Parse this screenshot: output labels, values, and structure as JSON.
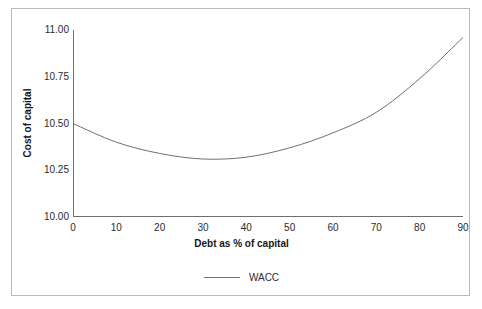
{
  "chart_data": {
    "type": "line",
    "title": "",
    "xlabel": "Debt as % of capital",
    "ylabel": "Cost of capital",
    "xlim": [
      0,
      90
    ],
    "ylim": [
      10.0,
      11.0
    ],
    "xticks": [
      "0",
      "10",
      "20",
      "30",
      "40",
      "50",
      "60",
      "70",
      "80",
      "90"
    ],
    "yticks": [
      "10.00",
      "10.25",
      "10.50",
      "10.75",
      "11.00"
    ],
    "grid": false,
    "legend_position": "bottom-center",
    "x": [
      0,
      10,
      20,
      30,
      40,
      50,
      60,
      70,
      80,
      90
    ],
    "series": [
      {
        "name": "WACC",
        "color": "#6f6f6f",
        "values": [
          10.5,
          10.4,
          10.34,
          10.31,
          10.32,
          10.37,
          10.45,
          10.56,
          10.74,
          10.96
        ]
      }
    ]
  },
  "legend": {
    "entries": [
      {
        "label": "WACC",
        "color": "#6f6f6f"
      }
    ]
  },
  "axes": {
    "x_title": "Debt as % of capital",
    "y_title": "Cost of capital"
  },
  "colors": {
    "line": "#6f6f6f",
    "axis": "#6f6f6f",
    "frame": "#b9b9b9",
    "text": "#2b2b2b",
    "background": "#ffffff"
  }
}
